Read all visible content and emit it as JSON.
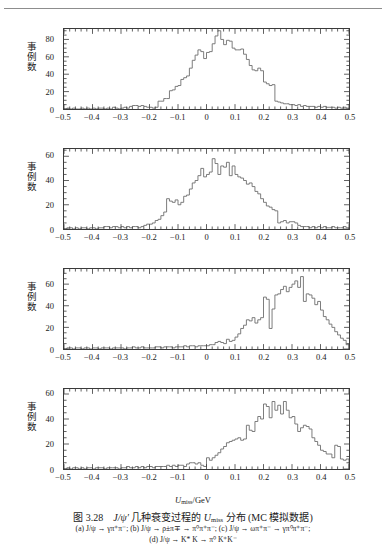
{
  "header": {
    "running_head": "",
    "rule_color": "#8d8d8d"
  },
  "figure": {
    "number": "图 3.28",
    "title_main": "几种衰变过程的",
    "title_symbol": "J/ψ′",
    "title_var": "U",
    "title_var_sub": "miss",
    "title_tail": "分布 (MC 模拟数据)",
    "caption_line_1": "(a) J/ψ → γπ⁺π⁻; (b) J/ψ → ρ±π∓ → π⁰π⁺π⁻; (c) J/ψ → ωπ⁺π⁻ → γπ⁰π⁺π⁻;",
    "caption_line_2": "(d) J/ψ → K* K → π⁰ K⁺K⁻"
  },
  "axis_title": {
    "variable": "U",
    "subscript": "miss",
    "unit": "/GeV"
  },
  "ylabel": "事例数",
  "colors": {
    "ink": "#1a1a1a",
    "curve": "#6e6e6e",
    "frame": "#3a3a3a",
    "paper": "#ffffff"
  },
  "chart_data": [
    {
      "id": "a",
      "type": "line",
      "panel_label": "(a)",
      "title": "",
      "xlabel": "U_miss/GeV",
      "ylabel": "事例数",
      "xlim": [
        -0.5,
        0.5
      ],
      "ylim": [
        0,
        92
      ],
      "xticks": [
        -0.5,
        -0.4,
        -0.3,
        -0.2,
        -0.1,
        0,
        0.1,
        0.2,
        0.3,
        0.4,
        0.5
      ],
      "xticklabels": [
        "−0.5",
        "−0.4",
        "−0.3",
        "−0.2",
        "−0.1",
        "0",
        "0.1",
        "0.2",
        "0.3",
        "0.4",
        "0.5"
      ],
      "yticks": [
        0,
        20,
        40,
        60,
        80
      ],
      "yticklabels": [
        "0",
        "20",
        "40",
        "60",
        "80"
      ],
      "grid": false,
      "bin_width": 0.01,
      "x": [
        -0.5,
        -0.49,
        -0.48,
        -0.47,
        -0.46,
        -0.45,
        -0.44,
        -0.43,
        -0.42,
        -0.41,
        -0.4,
        -0.39,
        -0.38,
        -0.37,
        -0.36,
        -0.35,
        -0.34,
        -0.33,
        -0.32,
        -0.31,
        -0.3,
        -0.29,
        -0.28,
        -0.27,
        -0.26,
        -0.25,
        -0.24,
        -0.23,
        -0.22,
        -0.21,
        -0.2,
        -0.19,
        -0.18,
        -0.17,
        -0.16,
        -0.15,
        -0.14,
        -0.13,
        -0.12,
        -0.11,
        -0.1,
        -0.09,
        -0.08,
        -0.07,
        -0.06,
        -0.05,
        -0.04,
        -0.03,
        -0.02,
        -0.01,
        0.0,
        0.01,
        0.02,
        0.03,
        0.04,
        0.05,
        0.06,
        0.07,
        0.08,
        0.09,
        0.1,
        0.11,
        0.12,
        0.13,
        0.14,
        0.15,
        0.16,
        0.17,
        0.18,
        0.19,
        0.2,
        0.21,
        0.22,
        0.23,
        0.24,
        0.25,
        0.26,
        0.27,
        0.28,
        0.29,
        0.3,
        0.31,
        0.32,
        0.33,
        0.34,
        0.35,
        0.36,
        0.37,
        0.38,
        0.39,
        0.4,
        0.41,
        0.42,
        0.43,
        0.44,
        0.45,
        0.46,
        0.47,
        0.48,
        0.49
      ],
      "values": [
        0,
        1,
        0,
        1,
        0,
        0,
        1,
        0,
        1,
        0,
        1,
        0,
        1,
        1,
        0,
        1,
        0,
        2,
        1,
        0,
        1,
        2,
        1,
        3,
        4,
        4,
        3,
        4,
        3,
        2,
        2,
        1,
        2,
        9,
        9,
        12,
        12,
        21,
        22,
        26,
        27,
        34,
        36,
        38,
        47,
        56,
        62,
        68,
        66,
        58,
        65,
        66,
        75,
        84,
        90,
        80,
        74,
        79,
        78,
        70,
        68,
        68,
        69,
        63,
        57,
        50,
        45,
        44,
        47,
        44,
        31,
        29,
        27,
        28,
        9,
        8,
        7,
        6,
        6,
        5,
        5,
        4,
        5,
        3,
        4,
        3,
        3,
        3,
        2,
        3,
        2,
        3,
        2,
        2,
        2,
        1,
        2,
        1,
        2,
        1
      ]
    },
    {
      "id": "b",
      "type": "line",
      "panel_label": "(b)",
      "title": "",
      "xlabel": "U_miss/GeV",
      "ylabel": "事例数",
      "xlim": [
        -0.5,
        0.5
      ],
      "ylim": [
        0,
        66
      ],
      "xticks": [
        -0.5,
        -0.4,
        -0.3,
        -0.2,
        -0.1,
        0,
        0.1,
        0.2,
        0.3,
        0.4,
        0.5
      ],
      "xticklabels": [
        "−0.5",
        "−0.4",
        "−0.3",
        "−0.2",
        "−0.1",
        "0",
        "0.1",
        "0.2",
        "0.3",
        "0.4",
        "0.5"
      ],
      "yticks": [
        0,
        20,
        40,
        60
      ],
      "yticklabels": [
        "0",
        "20",
        "40",
        "60"
      ],
      "grid": false,
      "bin_width": 0.01,
      "x": [
        -0.5,
        -0.49,
        -0.48,
        -0.47,
        -0.46,
        -0.45,
        -0.44,
        -0.43,
        -0.42,
        -0.41,
        -0.4,
        -0.39,
        -0.38,
        -0.37,
        -0.36,
        -0.35,
        -0.34,
        -0.33,
        -0.32,
        -0.31,
        -0.3,
        -0.29,
        -0.28,
        -0.27,
        -0.26,
        -0.25,
        -0.24,
        -0.23,
        -0.22,
        -0.21,
        -0.2,
        -0.19,
        -0.18,
        -0.17,
        -0.16,
        -0.15,
        -0.14,
        -0.13,
        -0.12,
        -0.11,
        -0.1,
        -0.09,
        -0.08,
        -0.07,
        -0.06,
        -0.05,
        -0.04,
        -0.03,
        -0.02,
        -0.01,
        0.0,
        0.01,
        0.02,
        0.03,
        0.04,
        0.05,
        0.06,
        0.07,
        0.08,
        0.09,
        0.1,
        0.11,
        0.12,
        0.13,
        0.14,
        0.15,
        0.16,
        0.17,
        0.18,
        0.19,
        0.2,
        0.21,
        0.22,
        0.23,
        0.24,
        0.25,
        0.26,
        0.27,
        0.28,
        0.29,
        0.3,
        0.31,
        0.32,
        0.33,
        0.34,
        0.35,
        0.36,
        0.37,
        0.38,
        0.39,
        0.4,
        0.41,
        0.42,
        0.43,
        0.44,
        0.45,
        0.46,
        0.47,
        0.48,
        0.49
      ],
      "values": [
        0,
        1,
        1,
        0,
        1,
        0,
        1,
        1,
        0,
        1,
        1,
        0,
        1,
        1,
        2,
        2,
        1,
        2,
        2,
        1,
        2,
        1,
        2,
        1,
        2,
        2,
        1,
        2,
        3,
        4,
        4,
        5,
        7,
        8,
        11,
        14,
        25,
        23,
        22,
        24,
        20,
        22,
        27,
        28,
        33,
        38,
        40,
        44,
        50,
        43,
        45,
        47,
        58,
        54,
        45,
        52,
        51,
        55,
        44,
        52,
        45,
        43,
        42,
        40,
        37,
        38,
        35,
        31,
        29,
        25,
        22,
        19,
        18,
        16,
        15,
        5,
        6,
        7,
        5,
        6,
        6,
        5,
        3,
        2,
        2,
        2,
        1,
        2,
        1,
        2,
        1,
        2,
        1,
        1,
        2,
        1,
        1,
        1,
        2,
        1
      ]
    },
    {
      "id": "c",
      "type": "line",
      "panel_label": "(c)",
      "title": "",
      "xlabel": "U_miss/GeV",
      "ylabel": "事例数",
      "xlim": [
        -0.5,
        0.5
      ],
      "ylim": [
        0,
        74
      ],
      "xticks": [
        -0.5,
        -0.4,
        -0.3,
        -0.2,
        -0.1,
        0,
        0.1,
        0.2,
        0.3,
        0.4,
        0.5
      ],
      "xticklabels": [
        "−0.5",
        "−0.4",
        "−0.3",
        "−0.2",
        "−0.1",
        "0",
        "0.1",
        "0.2",
        "0.3",
        "0.4",
        "0.5"
      ],
      "yticks": [
        0,
        20,
        40,
        60
      ],
      "yticklabels": [
        "0",
        "20",
        "40",
        "60"
      ],
      "grid": false,
      "bin_width": 0.01,
      "x": [
        -0.5,
        -0.49,
        -0.48,
        -0.47,
        -0.46,
        -0.45,
        -0.44,
        -0.43,
        -0.42,
        -0.41,
        -0.4,
        -0.39,
        -0.38,
        -0.37,
        -0.36,
        -0.35,
        -0.34,
        -0.33,
        -0.32,
        -0.31,
        -0.3,
        -0.29,
        -0.28,
        -0.27,
        -0.26,
        -0.25,
        -0.24,
        -0.23,
        -0.22,
        -0.21,
        -0.2,
        -0.19,
        -0.18,
        -0.17,
        -0.16,
        -0.15,
        -0.14,
        -0.13,
        -0.12,
        -0.11,
        -0.1,
        -0.09,
        -0.08,
        -0.07,
        -0.06,
        -0.05,
        -0.04,
        -0.03,
        -0.02,
        -0.01,
        0.0,
        0.01,
        0.02,
        0.03,
        0.04,
        0.05,
        0.06,
        0.07,
        0.08,
        0.09,
        0.1,
        0.11,
        0.12,
        0.13,
        0.14,
        0.15,
        0.16,
        0.17,
        0.18,
        0.19,
        0.2,
        0.21,
        0.22,
        0.23,
        0.24,
        0.25,
        0.26,
        0.27,
        0.28,
        0.29,
        0.3,
        0.31,
        0.32,
        0.33,
        0.34,
        0.35,
        0.36,
        0.37,
        0.38,
        0.39,
        0.4,
        0.41,
        0.42,
        0.43,
        0.44,
        0.45,
        0.46,
        0.47,
        0.48,
        0.49
      ],
      "values": [
        0,
        1,
        1,
        0,
        1,
        1,
        0,
        1,
        1,
        0,
        1,
        1,
        0,
        1,
        1,
        1,
        0,
        1,
        1,
        1,
        1,
        0,
        1,
        1,
        2,
        1,
        1,
        2,
        1,
        1,
        1,
        1,
        2,
        2,
        1,
        2,
        2,
        2,
        1,
        2,
        2,
        2,
        3,
        2,
        3,
        3,
        2,
        3,
        3,
        3,
        3,
        4,
        4,
        6,
        7,
        6,
        5,
        9,
        7,
        8,
        11,
        14,
        19,
        22,
        27,
        26,
        29,
        24,
        27,
        29,
        48,
        46,
        19,
        37,
        50,
        51,
        55,
        58,
        53,
        57,
        60,
        63,
        57,
        67,
        44,
        51,
        50,
        47,
        41,
        44,
        36,
        30,
        27,
        23,
        20,
        16,
        13,
        10,
        8,
        4
      ]
    },
    {
      "id": "d",
      "type": "line",
      "panel_label": "(d)",
      "title": "",
      "xlabel": "U_miss/GeV",
      "ylabel": "事例数",
      "xlim": [
        -0.5,
        0.5
      ],
      "ylim": [
        0,
        64
      ],
      "xticks": [
        -0.5,
        -0.4,
        -0.3,
        -0.2,
        -0.1,
        0,
        0.1,
        0.2,
        0.3,
        0.4,
        0.5
      ],
      "xticklabels": [
        "−0.5",
        "−0.4",
        "−0.3",
        "−0.2",
        "−0.1",
        "0",
        "0.1",
        "0.2",
        "0.3",
        "0.4",
        "0.5"
      ],
      "yticks": [
        0,
        20,
        40,
        60
      ],
      "yticklabels": [
        "0",
        "20",
        "40",
        "60"
      ],
      "grid": false,
      "bin_width": 0.01,
      "x": [
        -0.5,
        -0.49,
        -0.48,
        -0.47,
        -0.46,
        -0.45,
        -0.44,
        -0.43,
        -0.42,
        -0.41,
        -0.4,
        -0.39,
        -0.38,
        -0.37,
        -0.36,
        -0.35,
        -0.34,
        -0.33,
        -0.32,
        -0.31,
        -0.3,
        -0.29,
        -0.28,
        -0.27,
        -0.26,
        -0.25,
        -0.24,
        -0.23,
        -0.22,
        -0.21,
        -0.2,
        -0.19,
        -0.18,
        -0.17,
        -0.16,
        -0.15,
        -0.14,
        -0.13,
        -0.12,
        -0.11,
        -0.1,
        -0.09,
        -0.08,
        -0.07,
        -0.06,
        -0.05,
        -0.04,
        -0.03,
        -0.02,
        -0.01,
        0.0,
        0.01,
        0.02,
        0.03,
        0.04,
        0.05,
        0.06,
        0.07,
        0.08,
        0.09,
        0.1,
        0.11,
        0.12,
        0.13,
        0.14,
        0.15,
        0.16,
        0.17,
        0.18,
        0.19,
        0.2,
        0.21,
        0.22,
        0.23,
        0.24,
        0.25,
        0.26,
        0.27,
        0.28,
        0.29,
        0.3,
        0.31,
        0.32,
        0.33,
        0.34,
        0.35,
        0.36,
        0.37,
        0.38,
        0.39,
        0.4,
        0.41,
        0.42,
        0.43,
        0.44,
        0.45,
        0.46,
        0.47,
        0.48,
        0.49
      ],
      "values": [
        0,
        1,
        0,
        1,
        1,
        0,
        1,
        0,
        1,
        1,
        0,
        1,
        1,
        1,
        0,
        1,
        1,
        1,
        1,
        0,
        1,
        1,
        2,
        1,
        1,
        2,
        1,
        2,
        1,
        2,
        2,
        1,
        2,
        2,
        2,
        2,
        3,
        2,
        3,
        2,
        3,
        3,
        2,
        4,
        5,
        5,
        4,
        5,
        3,
        2,
        9,
        7,
        9,
        11,
        13,
        16,
        18,
        21,
        22,
        23,
        24,
        25,
        23,
        24,
        35,
        31,
        30,
        38,
        42,
        40,
        52,
        50,
        41,
        54,
        47,
        51,
        44,
        54,
        47,
        41,
        42,
        36,
        30,
        33,
        35,
        34,
        32,
        25,
        22,
        19,
        15,
        14,
        12,
        12,
        9,
        19,
        18,
        8,
        7,
        8
      ]
    }
  ],
  "panels": [
    {
      "label": "(a)"
    },
    {
      "label": "(b)"
    },
    {
      "label": "(c)"
    },
    {
      "label": "(d)"
    }
  ]
}
